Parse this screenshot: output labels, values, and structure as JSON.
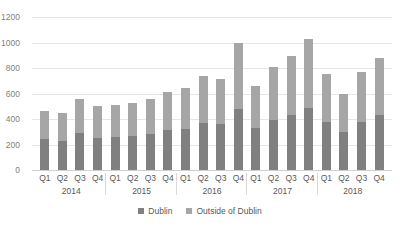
{
  "chart_data": {
    "type": "bar",
    "stacked": true,
    "title": "",
    "xlabel": "",
    "ylabel": "",
    "ylim": [
      0,
      1200
    ],
    "yticks": [
      1200,
      1000,
      800,
      600,
      400,
      200,
      0
    ],
    "grid": true,
    "legend_position": "bottom",
    "categories": [
      "Q1",
      "Q2",
      "Q3",
      "Q4",
      "Q1",
      "Q2",
      "Q3",
      "Q4",
      "Q1",
      "Q2",
      "Q3",
      "Q4",
      "Q1",
      "Q2",
      "Q3",
      "Q4",
      "Q1",
      "Q2",
      "Q3",
      "Q4"
    ],
    "group_labels": [
      "2014",
      "2015",
      "2016",
      "2017",
      "2018"
    ],
    "series": [
      {
        "name": "Dublin",
        "color": "#808080",
        "values": [
          240,
          225,
          290,
          255,
          260,
          270,
          285,
          310,
          325,
          370,
          360,
          480,
          330,
          395,
          430,
          490,
          375,
          300,
          380,
          430
        ]
      },
      {
        "name": "Outside of Dublin",
        "color": "#a6a6a6",
        "values": [
          225,
          225,
          265,
          245,
          250,
          255,
          275,
          300,
          315,
          370,
          355,
          515,
          330,
          410,
          465,
          540,
          375,
          300,
          385,
          445
        ]
      }
    ],
    "totals": [
      465,
      450,
      555,
      500,
      510,
      525,
      560,
      610,
      640,
      740,
      715,
      995,
      660,
      805,
      895,
      1030,
      750,
      600,
      765,
      875
    ]
  },
  "legend": {
    "items": [
      {
        "label": "Dublin",
        "color": "#808080"
      },
      {
        "label": "Outside of Dublin",
        "color": "#a6a6a6"
      }
    ]
  }
}
